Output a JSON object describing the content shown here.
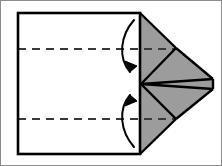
{
  "figure": {
    "canvas": {
      "width": 222,
      "height": 166
    },
    "colors": {
      "background": "#ffffff",
      "paper_fill": "#ffffff",
      "flap_fill": "#9c9c9c",
      "stroke": "#000000",
      "crease": "#3a3a3a",
      "frame": "#8c8c8c"
    },
    "stroke_widths": {
      "outline": 2.6,
      "fold_edge": 2.4,
      "crease": 1.8,
      "arrow": 2.0,
      "frame": 1.0
    },
    "geometry": {
      "sheet": {
        "left": 18,
        "right": 140,
        "top": 13,
        "bottom": 154
      },
      "apex": {
        "x": 141,
        "y": 84
      },
      "tip_upper": {
        "x": 213,
        "y": 79
      },
      "tip_lower": {
        "x": 213,
        "y": 89
      },
      "corner_upper": {
        "x": 176,
        "y": 48
      },
      "corner_lower": {
        "x": 176,
        "y": 119
      },
      "crease_upper_y": 49,
      "crease_lower_y": 119,
      "dash_pattern": "8 6"
    },
    "elements": {
      "sheet_label": "paper-sheet",
      "upper_flap_label": "upper-folded-flap",
      "lower_flap_label": "lower-folded-flap",
      "upper_crease_label": "upper-crease-line",
      "lower_crease_label": "lower-crease-line",
      "arrow_down_label": "fold-down-arrow",
      "arrow_up_label": "fold-up-arrow"
    }
  }
}
